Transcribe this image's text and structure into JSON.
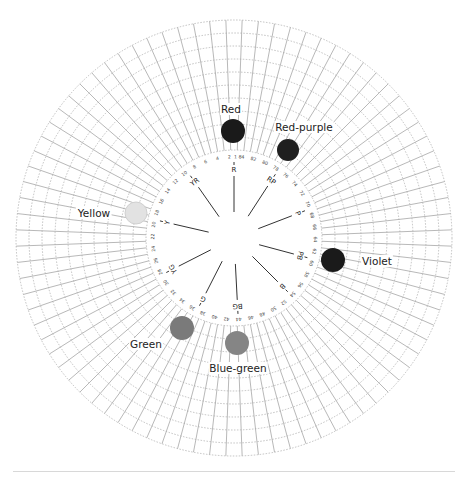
{
  "diagram": {
    "center": [
      234,
      238
    ],
    "outer_radius": 218,
    "grid_inner_radius": 88,
    "ring_count": 10,
    "radial_divisions": 84,
    "number_ring_radius": 81,
    "spoke_inner_radius": 26,
    "spoke_outer_radius": 76,
    "hue_numbers_step": 2,
    "hue_labels": [
      {
        "label": "R",
        "angle": -90
      },
      {
        "label": "RP",
        "angle": -57
      },
      {
        "label": "P",
        "angle": -21
      },
      {
        "label": "PB",
        "angle": 15
      },
      {
        "label": "B",
        "angle": 45
      },
      {
        "label": "BG",
        "angle": 87
      },
      {
        "label": "G",
        "angle": 117
      },
      {
        "label": "YG",
        "angle": 153
      },
      {
        "label": "Y",
        "angle": 193
      },
      {
        "label": "YR",
        "angle": 235
      }
    ],
    "samples": [
      {
        "name": "Red",
        "cx": 233,
        "cy": 131,
        "r": 12,
        "color": "#1a1a1a",
        "label_x": 231,
        "label_y": 113,
        "anchor": "middle"
      },
      {
        "name": "Red-purple",
        "cx": 288,
        "cy": 150,
        "r": 11,
        "color": "#1f1f1f",
        "label_x": 304,
        "label_y": 131,
        "anchor": "middle"
      },
      {
        "name": "Yellow",
        "cx": 136,
        "cy": 213,
        "r": 11,
        "color": "#e2e2e2",
        "label_x": 94,
        "label_y": 217,
        "anchor": "middle"
      },
      {
        "name": "Violet",
        "cx": 333,
        "cy": 260,
        "r": 12,
        "color": "#1a1a1a",
        "label_x": 377,
        "label_y": 265,
        "anchor": "middle"
      },
      {
        "name": "Green",
        "cx": 182,
        "cy": 328,
        "r": 12,
        "color": "#7a7a7a",
        "label_x": 146,
        "label_y": 348,
        "anchor": "middle"
      },
      {
        "name": "Blue-green",
        "cx": 237,
        "cy": 343,
        "r": 12,
        "color": "#858585",
        "label_x": 238,
        "label_y": 372,
        "anchor": "middle"
      }
    ],
    "colors": {
      "grid_line": "#9a9a9a",
      "ring_dash": "#a8a8a8",
      "spoke": "#333333",
      "text": "#222222",
      "number_text": "#444444"
    }
  }
}
